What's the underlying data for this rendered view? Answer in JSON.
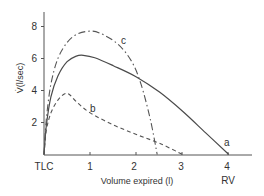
{
  "chart_data": {
    "type": "line",
    "title": "",
    "xlabel": "Volume expired (l)",
    "ylabel": "V̇(l/sec)",
    "xlim": [
      0,
      4.6
    ],
    "ylim": [
      0,
      8.5
    ],
    "grid": false,
    "legend": "none (inline curve labels a, b, c)",
    "x_ticks": [
      {
        "value": 0,
        "label": "TLC"
      },
      {
        "value": 1,
        "label": "1"
      },
      {
        "value": 2,
        "label": "2"
      },
      {
        "value": 3,
        "label": "3"
      },
      {
        "value": 4,
        "label": "4"
      }
    ],
    "x_sublabels": [
      {
        "value": 4,
        "label": "RV"
      }
    ],
    "y_ticks": [
      {
        "value": 2,
        "label": "2"
      },
      {
        "value": 4,
        "label": "4"
      },
      {
        "value": 6,
        "label": "6"
      },
      {
        "value": 8,
        "label": "8"
      }
    ],
    "series": [
      {
        "name": "a",
        "style": "solid",
        "points": [
          [
            0,
            0
          ],
          [
            0.05,
            1.8
          ],
          [
            0.15,
            3.6
          ],
          [
            0.3,
            4.9
          ],
          [
            0.5,
            5.8
          ],
          [
            0.7,
            6.15
          ],
          [
            0.85,
            6.2
          ],
          [
            1.1,
            6.05
          ],
          [
            1.5,
            5.55
          ],
          [
            2.0,
            4.85
          ],
          [
            2.5,
            3.9
          ],
          [
            3.0,
            2.7
          ],
          [
            3.5,
            1.35
          ],
          [
            4.0,
            0
          ]
        ],
        "label_pos": [
          3.95,
          0.75
        ]
      },
      {
        "name": "b",
        "style": "dashed",
        "points": [
          [
            0,
            0
          ],
          [
            0.05,
            1.5
          ],
          [
            0.15,
            2.6
          ],
          [
            0.3,
            3.4
          ],
          [
            0.45,
            3.8
          ],
          [
            0.55,
            3.75
          ],
          [
            0.7,
            3.3
          ],
          [
            1.0,
            2.6
          ],
          [
            1.5,
            1.85
          ],
          [
            2.0,
            1.25
          ],
          [
            2.5,
            0.7
          ],
          [
            3.0,
            0
          ]
        ],
        "label_pos": [
          1.05,
          2.8
        ]
      },
      {
        "name": "c",
        "style": "dash-dot",
        "points": [
          [
            0,
            0
          ],
          [
            0.05,
            2.2
          ],
          [
            0.15,
            4.4
          ],
          [
            0.3,
            6.0
          ],
          [
            0.5,
            7.0
          ],
          [
            0.7,
            7.5
          ],
          [
            0.95,
            7.7
          ],
          [
            1.2,
            7.6
          ],
          [
            1.6,
            6.9
          ],
          [
            1.9,
            5.8
          ],
          [
            2.1,
            4.4
          ],
          [
            2.3,
            2.2
          ],
          [
            2.45,
            0
          ]
        ],
        "label_pos": [
          1.75,
          7.05
        ]
      }
    ]
  },
  "labels": {
    "ylabel": "V̇(l/sec)",
    "xlabel": "Volume expired (l)",
    "tlc": "TLC",
    "rv": "RV",
    "x1": "1",
    "x2": "2",
    "x3": "3",
    "x4": "4",
    "y2": "2",
    "y4": "4",
    "y6": "6",
    "y8": "8",
    "curve_a": "a",
    "curve_b": "b",
    "curve_c": "c"
  },
  "colors": {
    "axis": "#555555",
    "curve": "#4a4a4a",
    "text": "#333333"
  }
}
